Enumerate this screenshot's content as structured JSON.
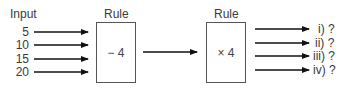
{
  "diagram": {
    "input_label": "Input",
    "inputs": [
      "5",
      "10",
      "15",
      "20"
    ],
    "rules": [
      {
        "label": "Rule",
        "operation": "− 4"
      },
      {
        "label": "Rule",
        "operation": "× 4"
      }
    ],
    "outputs": [
      "i) ?",
      "ii) ?",
      "iii) ?",
      "iv) ?"
    ],
    "colors": {
      "line": "#111111",
      "box_border": "#555555",
      "text": "#3a3a3a"
    }
  }
}
